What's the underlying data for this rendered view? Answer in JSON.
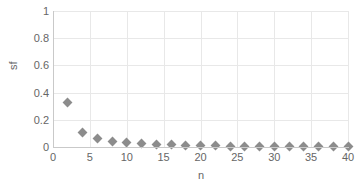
{
  "chart_data": {
    "type": "scatter",
    "title": "",
    "xlabel": "n",
    "ylabel": "sf",
    "xlim": [
      0,
      40
    ],
    "ylim": [
      0,
      1
    ],
    "xticks": [
      0,
      5,
      10,
      15,
      20,
      25,
      30,
      35,
      40
    ],
    "yticks": [
      0,
      0.2,
      0.4,
      0.6,
      0.8,
      1
    ],
    "xtick_labels": [
      "0",
      "5",
      "10",
      "15",
      "20",
      "25",
      "30",
      "35",
      "40"
    ],
    "ytick_labels": [
      "0",
      "0.2",
      "0.4",
      "0.6",
      "0.8",
      "1"
    ],
    "grid": true,
    "legend": null,
    "marker": "diamond",
    "marker_color": "#8c8c8c",
    "series": [
      {
        "name": "sf",
        "x": [
          2,
          4,
          6,
          8,
          10,
          12,
          14,
          16,
          18,
          20,
          22,
          24,
          26,
          28,
          30,
          32,
          34,
          36,
          38,
          40
        ],
        "values": [
          0.33,
          0.105,
          0.062,
          0.043,
          0.032,
          0.024,
          0.019,
          0.015,
          0.012,
          0.01,
          0.008,
          0.007,
          0.006,
          0.005,
          0.004,
          0.004,
          0.003,
          0.003,
          0.002,
          0.002
        ]
      }
    ]
  }
}
